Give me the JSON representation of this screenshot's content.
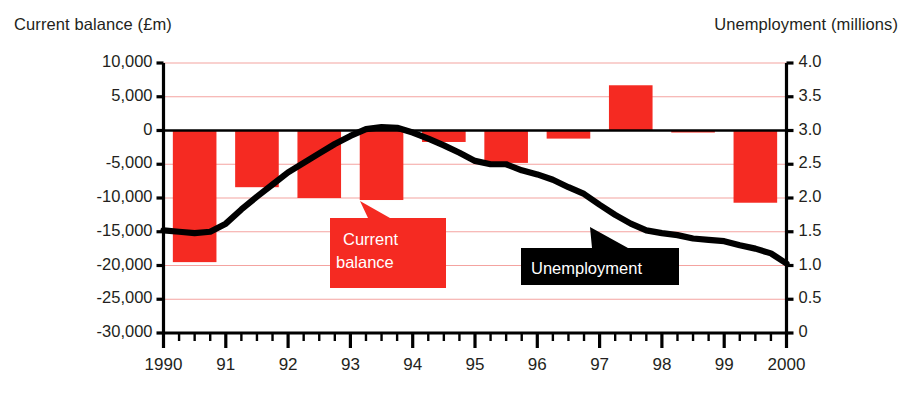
{
  "axes": {
    "left_title": "Current balance (£m)",
    "right_title": "Unemployment (millions)",
    "left_ticks": [
      "10,000",
      "5,000",
      "0",
      "-5,000",
      "-10,000",
      "-15,000",
      "-20,000",
      "-25,000",
      "-30,000"
    ],
    "right_ticks": [
      "4.0",
      "3.5",
      "3.0",
      "2.5",
      "2.0",
      "1.5",
      "1.0",
      "0.5",
      "0"
    ],
    "x_ticks": [
      "1990",
      "91",
      "92",
      "93",
      "94",
      "95",
      "96",
      "97",
      "98",
      "99",
      "2000"
    ]
  },
  "annotations": {
    "current_balance_line1": "Current",
    "current_balance_line2": "balance",
    "unemployment": "Unemployment"
  },
  "colors": {
    "bar_red": "#F52A22",
    "gridline_red": "#F4A3A0",
    "line_black": "#000000",
    "text_dark": "#231F20",
    "callout_text": "#FFFFFF"
  },
  "chart_data": {
    "type": "bar",
    "title": "",
    "xlabel": "",
    "grid": true,
    "legend_position": "inline-callouts",
    "categories": [
      "1990",
      "1991",
      "1992",
      "1993",
      "1994",
      "1995",
      "1996",
      "1997",
      "1998",
      "1999"
    ],
    "series": [
      {
        "name": "Current balance",
        "type": "bar",
        "unit": "£m",
        "axis": "left",
        "ylabel": "Current balance (£m)",
        "ylim": [
          -30000,
          10000
        ],
        "ytick_step": 5000,
        "values": [
          -19500,
          -8400,
          -10000,
          -10300,
          -1700,
          -4800,
          -1200,
          6700,
          -300,
          -10700
        ]
      },
      {
        "name": "Unemployment",
        "type": "line",
        "unit": "millions",
        "axis": "right",
        "ylabel": "Unemployment (millions)",
        "ylim": [
          0,
          4.0
        ],
        "ytick_step": 0.5,
        "x": [
          1990.0,
          1990.25,
          1990.5,
          1990.75,
          1991.0,
          1991.25,
          1991.5,
          1991.75,
          1992.0,
          1992.25,
          1992.5,
          1992.75,
          1993.0,
          1993.25,
          1993.5,
          1993.75,
          1994.0,
          1994.25,
          1994.5,
          1994.75,
          1995.0,
          1995.25,
          1995.5,
          1995.75,
          1996.0,
          1996.25,
          1996.5,
          1996.75,
          1997.0,
          1997.25,
          1997.5,
          1997.75,
          1998.0,
          1998.25,
          1998.5,
          1998.75,
          1999.0,
          1999.25,
          1999.5,
          1999.75,
          2000.0
        ],
        "values": [
          1.52,
          1.5,
          1.48,
          1.5,
          1.62,
          1.83,
          2.02,
          2.2,
          2.38,
          2.52,
          2.66,
          2.8,
          2.92,
          3.02,
          3.05,
          3.04,
          2.97,
          2.88,
          2.78,
          2.67,
          2.55,
          2.5,
          2.5,
          2.41,
          2.35,
          2.27,
          2.16,
          2.06,
          1.9,
          1.75,
          1.62,
          1.52,
          1.48,
          1.45,
          1.4,
          1.38,
          1.36,
          1.3,
          1.25,
          1.18,
          1.03
        ]
      }
    ]
  }
}
